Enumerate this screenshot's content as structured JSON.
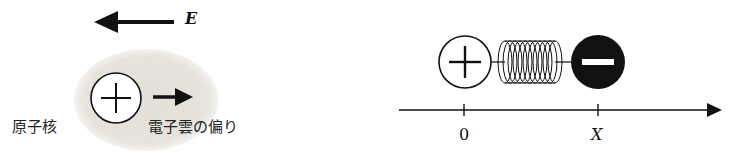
{
  "left_diagram": {
    "field_label": "E",
    "nucleus_label": "原子核",
    "cloud_label": "電子雲の偏り",
    "nucleus_symbol": "plus-icon",
    "cloud_color": "#e6e3dd"
  },
  "right_diagram": {
    "positive_symbol": "plus-icon",
    "negative_symbol": "minus-icon",
    "axis": {
      "ticks": [
        {
          "label": "0"
        },
        {
          "label": "X"
        }
      ]
    }
  }
}
